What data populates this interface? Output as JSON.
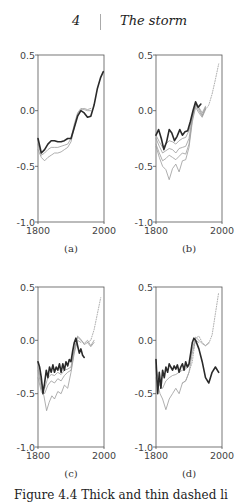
{
  "header": {
    "page_number": "4",
    "chapter_title": "The storm"
  },
  "caption_partial": "Figure 4.4  Thick and thin dashed li",
  "chart_data": [
    {
      "type": "line",
      "panel_label": "(a)",
      "xlim": [
        1800,
        2000
      ],
      "ylim": [
        -1.0,
        0.5
      ],
      "xticks": [
        "1800",
        "2000"
      ],
      "yticks": [
        "0.5",
        "0.0",
        "-0.5",
        "-1.0"
      ],
      "grid": false,
      "series": [
        {
          "name": "thick dark",
          "style": "solid-thick",
          "x": [
            1800,
            1810,
            1820,
            1830,
            1840,
            1850,
            1860,
            1870,
            1880,
            1890,
            1900,
            1910,
            1920,
            1930,
            1940,
            1950,
            1960,
            1970,
            1980,
            1990,
            1998
          ],
          "y": [
            -0.25,
            -0.38,
            -0.35,
            -0.3,
            -0.27,
            -0.27,
            -0.28,
            -0.28,
            -0.27,
            -0.25,
            -0.25,
            -0.15,
            -0.05,
            0.0,
            -0.02,
            -0.06,
            -0.05,
            0.05,
            0.2,
            0.3,
            0.35
          ]
        },
        {
          "name": "thin grey 1",
          "style": "solid-thin",
          "x": [
            1800,
            1810,
            1820,
            1830,
            1840,
            1850,
            1860,
            1870,
            1880,
            1890,
            1900,
            1910,
            1920,
            1930,
            1940,
            1950,
            1960
          ],
          "y": [
            -0.3,
            -0.4,
            -0.38,
            -0.35,
            -0.33,
            -0.33,
            -0.33,
            -0.32,
            -0.31,
            -0.3,
            -0.25,
            -0.12,
            -0.02,
            0.02,
            0.01,
            0.0,
            0.0
          ]
        },
        {
          "name": "thin grey 2",
          "style": "solid-thin",
          "x": [
            1800,
            1810,
            1820,
            1830,
            1840,
            1850,
            1860,
            1870,
            1880,
            1890,
            1900,
            1910,
            1920,
            1930,
            1940,
            1950,
            1960
          ],
          "y": [
            -0.35,
            -0.42,
            -0.45,
            -0.42,
            -0.4,
            -0.38,
            -0.38,
            -0.37,
            -0.35,
            -0.33,
            -0.28,
            -0.15,
            -0.03,
            0.01,
            0.02,
            0.01,
            0.02
          ]
        }
      ]
    },
    {
      "type": "line",
      "panel_label": "(b)",
      "xlim": [
        1800,
        2000
      ],
      "ylim": [
        -1.0,
        0.5
      ],
      "xticks": [
        "1800",
        "2000"
      ],
      "yticks": [
        "0.5",
        "0.0",
        "-0.5",
        "-1.0"
      ],
      "grid": false,
      "series": [
        {
          "name": "thick dark",
          "style": "solid-thick",
          "x": [
            1800,
            1808,
            1816,
            1824,
            1832,
            1840,
            1848,
            1856,
            1864,
            1872,
            1880,
            1888,
            1896,
            1904,
            1912,
            1920,
            1928,
            1936
          ],
          "y": [
            -0.22,
            -0.17,
            -0.25,
            -0.35,
            -0.28,
            -0.17,
            -0.2,
            -0.27,
            -0.23,
            -0.17,
            -0.22,
            -0.19,
            -0.18,
            -0.1,
            0.0,
            0.08,
            0.03,
            0.06
          ]
        },
        {
          "name": "thin grey 1",
          "style": "solid-thin",
          "x": [
            1800,
            1810,
            1820,
            1830,
            1840,
            1850,
            1860,
            1870,
            1880,
            1890,
            1900,
            1910,
            1920,
            1930,
            1940,
            1950
          ],
          "y": [
            -0.22,
            -0.28,
            -0.33,
            -0.3,
            -0.27,
            -0.28,
            -0.3,
            -0.27,
            -0.25,
            -0.24,
            -0.18,
            -0.05,
            0.05,
            0.03,
            -0.02,
            0.04
          ]
        },
        {
          "name": "thin grey 2",
          "style": "solid-thin",
          "x": [
            1800,
            1810,
            1820,
            1830,
            1840,
            1850,
            1860,
            1870,
            1880,
            1890,
            1900,
            1910,
            1920,
            1930,
            1940,
            1950
          ],
          "y": [
            -0.25,
            -0.32,
            -0.38,
            -0.36,
            -0.34,
            -0.35,
            -0.38,
            -0.34,
            -0.33,
            -0.32,
            -0.25,
            -0.06,
            0.06,
            0.02,
            -0.04,
            0.03
          ]
        },
        {
          "name": "thin grey 3",
          "style": "solid-thin",
          "x": [
            1800,
            1810,
            1820,
            1830,
            1840,
            1850,
            1860,
            1870,
            1880,
            1890,
            1900,
            1910,
            1920,
            1930,
            1940,
            1950
          ],
          "y": [
            -0.3,
            -0.38,
            -0.45,
            -0.43,
            -0.4,
            -0.42,
            -0.44,
            -0.41,
            -0.38,
            -0.39,
            -0.3,
            -0.08,
            0.05,
            0.0,
            -0.05,
            0.02
          ]
        },
        {
          "name": "thin grey 4",
          "style": "solid-thin",
          "x": [
            1800,
            1810,
            1820,
            1830,
            1840,
            1850,
            1860,
            1870,
            1880,
            1890,
            1900,
            1910,
            1920,
            1930,
            1940,
            1950
          ],
          "y": [
            -0.32,
            -0.42,
            -0.5,
            -0.53,
            -0.62,
            -0.52,
            -0.48,
            -0.55,
            -0.45,
            -0.44,
            -0.33,
            -0.1,
            0.03,
            -0.02,
            -0.06,
            0.01
          ]
        },
        {
          "name": "dotted",
          "style": "dotted",
          "x": [
            1950,
            1960,
            1970,
            1980,
            1990
          ],
          "y": [
            0.01,
            0.05,
            0.15,
            0.28,
            0.42
          ]
        }
      ]
    },
    {
      "type": "line",
      "panel_label": "(c)",
      "xlim": [
        1800,
        2000
      ],
      "ylim": [
        -1.0,
        0.5
      ],
      "xticks": [
        "1800",
        "2000"
      ],
      "yticks": [
        "0.5",
        "0.0",
        "-0.5",
        "-1.0"
      ],
      "grid": false,
      "series": [
        {
          "name": "thick dark",
          "style": "solid-thick",
          "x": [
            1800,
            1805,
            1810,
            1815,
            1820,
            1825,
            1830,
            1835,
            1840,
            1845,
            1850,
            1855,
            1860,
            1865,
            1870,
            1875,
            1880,
            1885,
            1890,
            1895,
            1900,
            1905,
            1910,
            1915,
            1920,
            1925,
            1930,
            1935,
            1940
          ],
          "y": [
            -0.2,
            -0.25,
            -0.35,
            -0.5,
            -0.4,
            -0.28,
            -0.35,
            -0.25,
            -0.3,
            -0.23,
            -0.3,
            -0.25,
            -0.28,
            -0.22,
            -0.3,
            -0.22,
            -0.28,
            -0.2,
            -0.24,
            -0.18,
            -0.2,
            -0.1,
            -0.02,
            0.02,
            -0.05,
            -0.12,
            -0.08,
            -0.14,
            -0.16
          ]
        },
        {
          "name": "thin grey 1",
          "style": "solid-thin",
          "x": [
            1800,
            1810,
            1820,
            1830,
            1840,
            1850,
            1860,
            1870,
            1880,
            1890,
            1900,
            1910,
            1920,
            1930,
            1940,
            1950,
            1960,
            1970
          ],
          "y": [
            -0.25,
            -0.4,
            -0.45,
            -0.35,
            -0.32,
            -0.33,
            -0.3,
            -0.32,
            -0.28,
            -0.27,
            -0.25,
            -0.08,
            0.03,
            0.0,
            -0.03,
            0.0,
            -0.05,
            0.0
          ]
        },
        {
          "name": "thin grey 2",
          "style": "solid-thin",
          "x": [
            1800,
            1810,
            1820,
            1830,
            1840,
            1850,
            1860,
            1870,
            1880,
            1890,
            1900,
            1910,
            1920,
            1930,
            1940,
            1950,
            1960,
            1970
          ],
          "y": [
            -0.28,
            -0.45,
            -0.5,
            -0.42,
            -0.38,
            -0.4,
            -0.36,
            -0.38,
            -0.33,
            -0.3,
            -0.28,
            -0.1,
            0.04,
            0.01,
            -0.04,
            -0.02,
            -0.06,
            -0.02
          ]
        },
        {
          "name": "thin grey 3",
          "style": "solid-thin",
          "x": [
            1800,
            1810,
            1818,
            1826,
            1834,
            1842,
            1850,
            1860,
            1870,
            1880,
            1890,
            1900,
            1910,
            1920,
            1930
          ],
          "y": [
            -0.35,
            -0.48,
            -0.52,
            -0.66,
            -0.58,
            -0.52,
            -0.55,
            -0.48,
            -0.5,
            -0.42,
            -0.45,
            -0.3,
            -0.12,
            0.0,
            -0.02
          ]
        },
        {
          "name": "dotted",
          "style": "dotted",
          "x": [
            1950,
            1960,
            1970,
            1980,
            1990
          ],
          "y": [
            -0.02,
            0.0,
            0.1,
            0.25,
            0.4
          ]
        }
      ]
    },
    {
      "type": "line",
      "panel_label": "(d)",
      "xlim": [
        1800,
        2000
      ],
      "ylim": [
        -1.0,
        0.5
      ],
      "xticks": [
        "1800",
        "2000"
      ],
      "yticks": [
        "0.5",
        "0.0",
        "-0.5",
        "-1.0"
      ],
      "grid": false,
      "series": [
        {
          "name": "thick dark",
          "style": "solid-thick",
          "x": [
            1800,
            1805,
            1810,
            1815,
            1820,
            1825,
            1830,
            1835,
            1840,
            1845,
            1850,
            1855,
            1860,
            1865,
            1870,
            1875,
            1880,
            1885,
            1890,
            1895,
            1900,
            1905,
            1910,
            1915,
            1920,
            1930,
            1940,
            1950,
            1960,
            1970,
            1980,
            1990
          ],
          "y": [
            -0.18,
            -0.5,
            -0.3,
            -0.45,
            -0.28,
            -0.35,
            -0.25,
            -0.3,
            -0.22,
            -0.25,
            -0.28,
            -0.24,
            -0.27,
            -0.23,
            -0.3,
            -0.25,
            -0.22,
            -0.28,
            -0.2,
            -0.25,
            -0.22,
            -0.12,
            -0.02,
            0.02,
            0.0,
            -0.08,
            -0.2,
            -0.35,
            -0.4,
            -0.3,
            -0.25,
            -0.3
          ]
        },
        {
          "name": "thin grey 1",
          "style": "solid-thin",
          "x": [
            1800,
            1810,
            1820,
            1830,
            1840,
            1850,
            1860,
            1870,
            1880,
            1890,
            1900,
            1910,
            1920,
            1930,
            1940,
            1950,
            1960
          ],
          "y": [
            -0.25,
            -0.42,
            -0.45,
            -0.38,
            -0.35,
            -0.33,
            -0.32,
            -0.3,
            -0.28,
            -0.27,
            -0.24,
            -0.08,
            0.03,
            0.0,
            -0.03,
            -0.05,
            -0.02
          ]
        },
        {
          "name": "thin grey 2",
          "style": "solid-thin",
          "x": [
            1800,
            1812,
            1820,
            1830,
            1840,
            1850,
            1860,
            1870,
            1880,
            1890,
            1900,
            1910,
            1920,
            1930
          ],
          "y": [
            -0.35,
            -0.5,
            -0.55,
            -0.65,
            -0.55,
            -0.5,
            -0.45,
            -0.5,
            -0.4,
            -0.38,
            -0.3,
            -0.12,
            0.0,
            -0.02
          ]
        },
        {
          "name": "dotted 1",
          "style": "dotted",
          "x": [
            1880,
            1890,
            1900,
            1910,
            1920,
            1930,
            1940,
            1950,
            1960,
            1970,
            1980,
            1990
          ],
          "y": [
            -0.4,
            -0.38,
            -0.3,
            -0.2,
            0.02,
            0.04,
            -0.02,
            -0.05,
            -0.03,
            0.05,
            0.25,
            0.45
          ]
        }
      ]
    }
  ]
}
